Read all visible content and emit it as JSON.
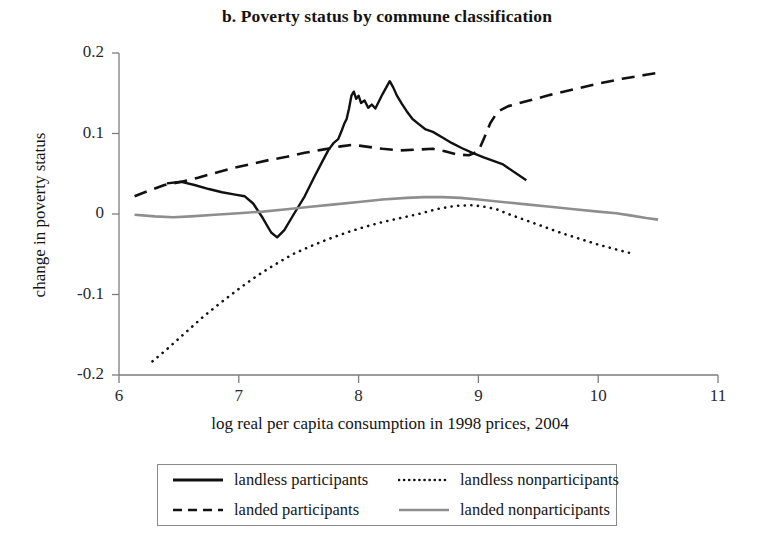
{
  "chart_data": {
    "type": "line",
    "title": "b. Poverty status by commune classification",
    "xlabel": "log real per capita consumption in 1998 prices, 2004",
    "ylabel": "change in poverty status",
    "xlim": [
      6,
      11
    ],
    "ylim": [
      -0.2,
      0.2
    ],
    "xticks": [
      6,
      7,
      8,
      9,
      10,
      11
    ],
    "xtick_labels": [
      "6",
      "7",
      "8",
      "9",
      "10",
      "11"
    ],
    "yticks": [
      -0.2,
      -0.1,
      0,
      0.1,
      0.2
    ],
    "ytick_labels": [
      "-0.2",
      "-0.1",
      "0",
      "0.1",
      "0.2"
    ],
    "grid": false,
    "legend_position": "below",
    "series": [
      {
        "name": "landless participants",
        "style": "solid",
        "color": "#111111",
        "width": 2.4,
        "points": [
          [
            6.4,
            0.038
          ],
          [
            6.52,
            0.04
          ],
          [
            6.63,
            0.036
          ],
          [
            6.75,
            0.031
          ],
          [
            6.86,
            0.027
          ],
          [
            6.97,
            0.024
          ],
          [
            7.05,
            0.022
          ],
          [
            7.12,
            0.013
          ],
          [
            7.2,
            -0.005
          ],
          [
            7.27,
            -0.023
          ],
          [
            7.32,
            -0.029
          ],
          [
            7.38,
            -0.02
          ],
          [
            7.46,
            0.0
          ],
          [
            7.55,
            0.022
          ],
          [
            7.63,
            0.046
          ],
          [
            7.7,
            0.066
          ],
          [
            7.75,
            0.08
          ],
          [
            7.79,
            0.088
          ],
          [
            7.83,
            0.093
          ],
          [
            7.86,
            0.104
          ],
          [
            7.88,
            0.112
          ],
          [
            7.9,
            0.118
          ],
          [
            7.92,
            0.131
          ],
          [
            7.94,
            0.147
          ],
          [
            7.96,
            0.152
          ],
          [
            7.98,
            0.143
          ],
          [
            8.0,
            0.147
          ],
          [
            8.02,
            0.138
          ],
          [
            8.05,
            0.141
          ],
          [
            8.08,
            0.132
          ],
          [
            8.11,
            0.136
          ],
          [
            8.14,
            0.131
          ],
          [
            8.17,
            0.14
          ],
          [
            8.2,
            0.149
          ],
          [
            8.23,
            0.157
          ],
          [
            8.26,
            0.165
          ],
          [
            8.29,
            0.157
          ],
          [
            8.32,
            0.147
          ],
          [
            8.36,
            0.137
          ],
          [
            8.4,
            0.128
          ],
          [
            8.45,
            0.118
          ],
          [
            8.5,
            0.112
          ],
          [
            8.56,
            0.105
          ],
          [
            8.62,
            0.102
          ],
          [
            8.7,
            0.095
          ],
          [
            8.78,
            0.088
          ],
          [
            8.86,
            0.082
          ],
          [
            8.95,
            0.076
          ],
          [
            9.05,
            0.07
          ],
          [
            9.2,
            0.062
          ],
          [
            9.4,
            0.042
          ]
        ]
      },
      {
        "name": "landed participants",
        "style": "dashed",
        "color": "#111111",
        "width": 2.6,
        "points": [
          [
            6.13,
            0.022
          ],
          [
            6.25,
            0.029
          ],
          [
            6.38,
            0.036
          ],
          [
            6.52,
            0.04
          ],
          [
            6.66,
            0.045
          ],
          [
            6.8,
            0.051
          ],
          [
            6.95,
            0.057
          ],
          [
            7.1,
            0.062
          ],
          [
            7.25,
            0.067
          ],
          [
            7.4,
            0.071
          ],
          [
            7.55,
            0.076
          ],
          [
            7.7,
            0.08
          ],
          [
            7.85,
            0.084
          ],
          [
            7.95,
            0.086
          ],
          [
            8.05,
            0.084
          ],
          [
            8.2,
            0.081
          ],
          [
            8.35,
            0.079
          ],
          [
            8.5,
            0.08
          ],
          [
            8.62,
            0.081
          ],
          [
            8.72,
            0.078
          ],
          [
            8.82,
            0.074
          ],
          [
            8.92,
            0.073
          ],
          [
            9.0,
            0.078
          ],
          [
            9.05,
            0.095
          ],
          [
            9.1,
            0.113
          ],
          [
            9.16,
            0.127
          ],
          [
            9.25,
            0.134
          ],
          [
            9.4,
            0.14
          ],
          [
            9.6,
            0.148
          ],
          [
            9.8,
            0.155
          ],
          [
            10.0,
            0.162
          ],
          [
            10.2,
            0.168
          ],
          [
            10.4,
            0.173
          ],
          [
            10.52,
            0.176
          ]
        ]
      },
      {
        "name": "landless nonparticipants",
        "style": "dotted",
        "color": "#111111",
        "width": 2.6,
        "points": [
          [
            6.28,
            -0.183
          ],
          [
            6.4,
            -0.168
          ],
          [
            6.55,
            -0.148
          ],
          [
            6.7,
            -0.128
          ],
          [
            6.85,
            -0.11
          ],
          [
            7.0,
            -0.093
          ],
          [
            7.15,
            -0.077
          ],
          [
            7.3,
            -0.063
          ],
          [
            7.45,
            -0.05
          ],
          [
            7.6,
            -0.04
          ],
          [
            7.75,
            -0.031
          ],
          [
            7.9,
            -0.023
          ],
          [
            8.05,
            -0.016
          ],
          [
            8.2,
            -0.01
          ],
          [
            8.35,
            -0.005
          ],
          [
            8.5,
            0.0
          ],
          [
            8.65,
            0.006
          ],
          [
            8.8,
            0.01
          ],
          [
            8.95,
            0.011
          ],
          [
            9.05,
            0.009
          ],
          [
            9.15,
            0.006
          ],
          [
            9.25,
            0.0
          ],
          [
            9.4,
            -0.008
          ],
          [
            9.55,
            -0.016
          ],
          [
            9.7,
            -0.024
          ],
          [
            9.85,
            -0.031
          ],
          [
            10.0,
            -0.038
          ],
          [
            10.15,
            -0.044
          ],
          [
            10.28,
            -0.049
          ]
        ]
      },
      {
        "name": "landed nonparticipants",
        "style": "solid",
        "color": "#8e8e8e",
        "width": 2.6,
        "points": [
          [
            6.13,
            -0.001
          ],
          [
            6.3,
            -0.003
          ],
          [
            6.45,
            -0.004
          ],
          [
            6.6,
            -0.003
          ],
          [
            6.8,
            -0.001
          ],
          [
            7.0,
            0.001
          ],
          [
            7.2,
            0.003
          ],
          [
            7.4,
            0.006
          ],
          [
            7.6,
            0.009
          ],
          [
            7.8,
            0.012
          ],
          [
            8.0,
            0.015
          ],
          [
            8.2,
            0.018
          ],
          [
            8.4,
            0.02
          ],
          [
            8.55,
            0.021
          ],
          [
            8.7,
            0.021
          ],
          [
            8.85,
            0.02
          ],
          [
            9.0,
            0.018
          ],
          [
            9.2,
            0.015
          ],
          [
            9.4,
            0.012
          ],
          [
            9.6,
            0.009
          ],
          [
            9.8,
            0.006
          ],
          [
            10.0,
            0.003
          ],
          [
            10.15,
            0.001
          ],
          [
            10.28,
            -0.002
          ],
          [
            10.4,
            -0.005
          ],
          [
            10.5,
            -0.007
          ]
        ]
      }
    ]
  },
  "legend": {
    "entries": [
      {
        "label": "landless participants",
        "style": "solid",
        "color": "#111111"
      },
      {
        "label": "landless nonparticipants",
        "style": "dotted",
        "color": "#111111"
      },
      {
        "label": "landed participants",
        "style": "dashed",
        "color": "#111111"
      },
      {
        "label": "landed nonparticipants",
        "style": "solid",
        "color": "#8e8e8e"
      }
    ]
  }
}
